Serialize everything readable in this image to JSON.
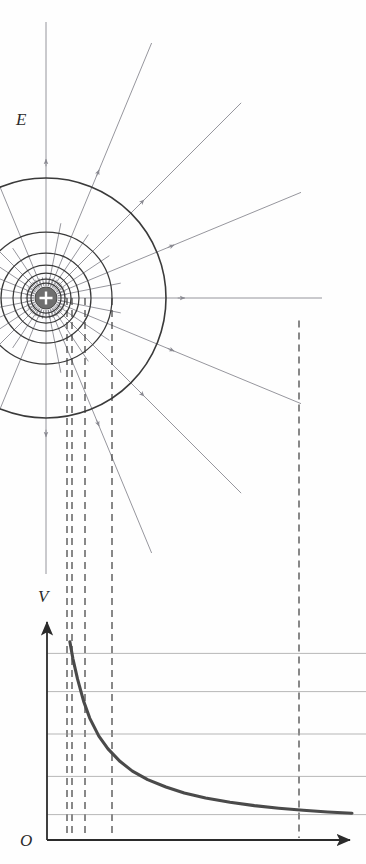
{
  "figure": {
    "title_visible": false,
    "labels": {
      "field_label": "E",
      "potential_axis_label": "V",
      "origin_label": "O"
    },
    "colors": {
      "equipotential_stroke": "#3a3a3a",
      "field_line_stroke": "#8a8a92",
      "charge_fill": "#6f6f6f",
      "charge_symbol": "#ffffff",
      "dashed_projection": "#3a3a3a",
      "curve_stroke": "#4a4a4a",
      "gridline": "#9a9a9a",
      "axis": "#2b2b2b",
      "background": "#fefefe"
    },
    "charge": {
      "sign": "+",
      "center_x": 46,
      "center_y": 298,
      "radius": 11
    },
    "equipotential_circles": {
      "description": "concentric equipotential surfaces around the point charge",
      "center_x": 46,
      "center_y": 298,
      "radii": [
        15,
        19,
        25,
        33,
        45,
        66,
        120,
        254
      ]
    },
    "field_lines": {
      "description": "radial electric field lines pointing away from the positive charge",
      "count": 24,
      "arrowheads": "outward",
      "long_line_angles_deg": [
        -90,
        -67.5,
        -45,
        -22.5,
        0,
        22.5,
        45,
        67.5,
        90
      ],
      "inner_only_angles_deg": [
        -157.5,
        -135,
        -112.5,
        112.5,
        135,
        157.5,
        180
      ]
    },
    "projection_lines": {
      "description": "vertical dashed lines projecting equipotential radii down onto the V-r graph",
      "x_positions": [
        67,
        72,
        85,
        112,
        299
      ]
    }
  },
  "chart_data": {
    "type": "line",
    "title": "",
    "xlabel": "",
    "ylabel": "V",
    "origin_label": "O",
    "grid": true,
    "gridline_y_values": [
      0.12,
      0.3,
      0.5,
      0.7,
      0.88
    ],
    "legend": null,
    "axis_x_range": [
      0,
      1
    ],
    "axis_y_range": [
      0,
      1
    ],
    "series": [
      {
        "name": "V(r) = k q / r",
        "x": [
          0.075,
          0.085,
          0.1,
          0.12,
          0.14,
          0.17,
          0.2,
          0.24,
          0.28,
          0.33,
          0.39,
          0.45,
          0.52,
          0.6,
          0.68,
          0.76,
          0.84,
          0.92,
          1.0
        ],
        "y": [
          0.935,
          0.855,
          0.76,
          0.655,
          0.575,
          0.49,
          0.43,
          0.37,
          0.325,
          0.285,
          0.25,
          0.222,
          0.198,
          0.178,
          0.162,
          0.15,
          0.14,
          0.132,
          0.126
        ]
      }
    ],
    "marked_x_values": [
      0.085,
      0.105,
      0.155,
      0.27,
      1.02
    ]
  }
}
